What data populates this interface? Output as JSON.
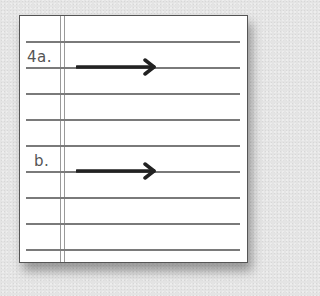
{
  "worksheet": {
    "items": [
      {
        "label": "4a.",
        "arrow": "right-arrow-icon"
      },
      {
        "label": "b.",
        "arrow": "right-arrow-icon"
      }
    ],
    "rule_count": 9,
    "colors": {
      "background": "#e4e4e4",
      "paper": "#ffffff",
      "rule": "#7a7a7a",
      "arrow": "#222222",
      "label": "#555555"
    }
  }
}
